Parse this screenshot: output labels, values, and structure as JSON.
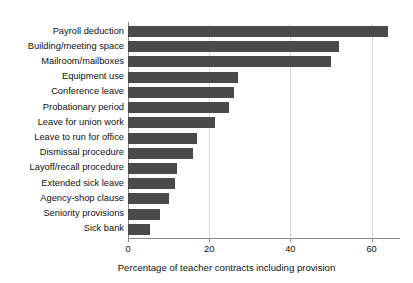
{
  "chart_data": {
    "type": "bar",
    "orientation": "horizontal",
    "title": "",
    "xlabel": "Percentage of teacher contracts including provision",
    "ylabel": "",
    "xlim": [
      0,
      67
    ],
    "xticks": [
      0,
      20,
      40,
      60
    ],
    "xtick_labels": [
      "0",
      "20",
      "40",
      "60"
    ],
    "grid": "vertical",
    "legend": "none",
    "bar_color": "#4a4a4a",
    "categories": [
      "Payroll deduction",
      "Building/meeting space",
      "Mailroom/mailboxes",
      "Equipment use",
      "Conference leave",
      "Probationary period",
      "Leave for union work",
      "Leave to run for office",
      "Dismissal procedure",
      "Layoff/recall procedure",
      "Extended sick leave",
      "Agency-shop clause",
      "Seniority provisions",
      "Sick bank"
    ],
    "values": [
      64,
      52,
      50,
      27,
      26,
      25,
      21.5,
      17,
      16,
      12,
      11.5,
      10,
      8,
      5.5
    ]
  }
}
